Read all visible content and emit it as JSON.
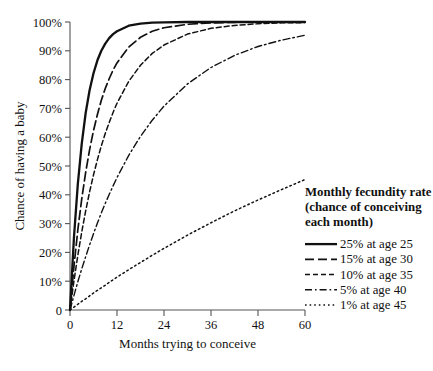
{
  "chart_data": {
    "type": "line",
    "title": "",
    "xlabel": "Months trying to conceive",
    "ylabel": "Chance of having a baby",
    "xlim": [
      0,
      60
    ],
    "ylim": [
      0,
      100
    ],
    "grid": false,
    "legend_position": "right",
    "legend_title_lines": [
      "Monthly fecundity rate",
      "(chance of conceiving",
      "each month)"
    ],
    "xticks": [
      0,
      12,
      24,
      36,
      48,
      60
    ],
    "xtick_labels": [
      "0",
      "12",
      "24",
      "36",
      "48",
      "60"
    ],
    "yticks": [
      0,
      10,
      20,
      30,
      40,
      50,
      60,
      70,
      80,
      90,
      100
    ],
    "ytick_labels": [
      "0",
      "10%",
      "20%",
      "30%",
      "40%",
      "50%",
      "60%",
      "70%",
      "80%",
      "90%",
      "100%"
    ],
    "x": [
      0,
      1,
      2,
      3,
      4,
      5,
      6,
      7,
      8,
      9,
      10,
      11,
      12,
      15,
      18,
      21,
      24,
      30,
      36,
      42,
      48,
      54,
      60
    ],
    "series": [
      {
        "name": "25% at age 25",
        "rate_percent": 25,
        "age": 25,
        "style": "solid",
        "color": "#111111",
        "values": [
          0,
          25.0,
          43.8,
          57.8,
          68.4,
          76.3,
          82.2,
          86.7,
          90.0,
          92.5,
          94.4,
          95.8,
          96.8,
          98.7,
          99.4,
          99.8,
          99.9,
          100.0,
          100.0,
          100.0,
          100.0,
          100.0,
          100.0
        ]
      },
      {
        "name": "15% at age 30",
        "rate_percent": 15,
        "age": 30,
        "style": "long-dash",
        "color": "#111111",
        "values": [
          0,
          15.0,
          27.8,
          38.6,
          47.8,
          55.6,
          62.3,
          67.9,
          72.8,
          76.9,
          80.3,
          83.3,
          85.8,
          91.3,
          94.7,
          96.8,
          98.0,
          99.2,
          99.7,
          99.9,
          100.0,
          100.0,
          100.0
        ]
      },
      {
        "name": "10% at age 35",
        "rate_percent": 10,
        "age": 35,
        "style": "short-dash",
        "color": "#111111",
        "values": [
          0,
          10.0,
          19.0,
          27.1,
          34.4,
          41.0,
          46.9,
          52.2,
          57.0,
          61.3,
          65.1,
          68.6,
          71.8,
          79.4,
          85.0,
          89.1,
          92.0,
          95.8,
          97.8,
          98.8,
          99.4,
          99.7,
          99.8
        ]
      },
      {
        "name": "5% at age 40",
        "rate_percent": 5,
        "age": 40,
        "style": "dash-dot",
        "color": "#111111",
        "values": [
          0,
          5.0,
          9.8,
          14.3,
          18.5,
          22.6,
          26.5,
          30.2,
          33.7,
          37.0,
          40.1,
          43.1,
          46.0,
          53.7,
          60.3,
          65.9,
          70.8,
          78.5,
          84.2,
          88.4,
          91.5,
          93.7,
          95.4
        ]
      },
      {
        "name": "1% at age 45",
        "rate_percent": 1,
        "age": 45,
        "style": "dotted",
        "color": "#111111",
        "values": [
          0,
          1.0,
          2.0,
          3.0,
          3.9,
          4.9,
          5.9,
          6.8,
          7.7,
          8.6,
          9.6,
          10.5,
          11.4,
          14.0,
          16.5,
          19.0,
          21.4,
          26.0,
          30.3,
          34.4,
          38.2,
          41.8,
          45.3
        ]
      }
    ]
  }
}
